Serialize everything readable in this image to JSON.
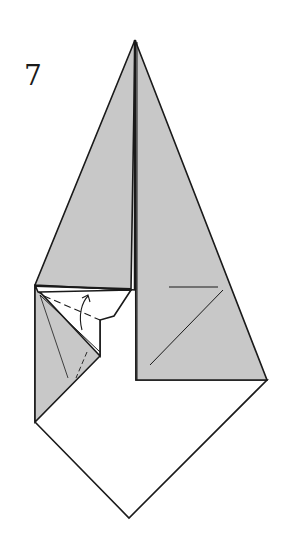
{
  "diagram": {
    "step_number": "7",
    "colors": {
      "paper_colored": "#c8c8c8",
      "paper_white": "#ffffff",
      "line": "#1a1a1a"
    },
    "shapes": {
      "apex": [
        135,
        40
      ],
      "left_corner": [
        35,
        285
      ],
      "right_corner": [
        267,
        380
      ],
      "bottom_left": [
        35,
        422
      ],
      "bottom_vertex": [
        129,
        518
      ],
      "inner_corner": [
        136,
        380
      ]
    },
    "annotations": {
      "arrow": "valley-fold-arrow",
      "dashed_lines": "valley-fold-lines"
    }
  }
}
